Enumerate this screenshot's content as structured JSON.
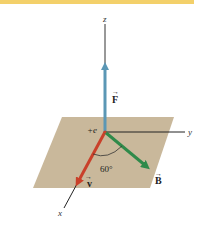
{
  "figure": {
    "accent_bar_color": "#f3d06a",
    "plane_color": "#c9b89b",
    "axes": {
      "z_label": "z",
      "y_label": "y",
      "x_label": "x"
    },
    "charge_label": "+e",
    "vectors": {
      "F": {
        "label": "F",
        "color": "#5b97b5"
      },
      "v": {
        "label": "v",
        "color": "#c9402a"
      },
      "B": {
        "label": "B",
        "color": "#2f8a4a"
      }
    },
    "angle_label": "60°"
  }
}
